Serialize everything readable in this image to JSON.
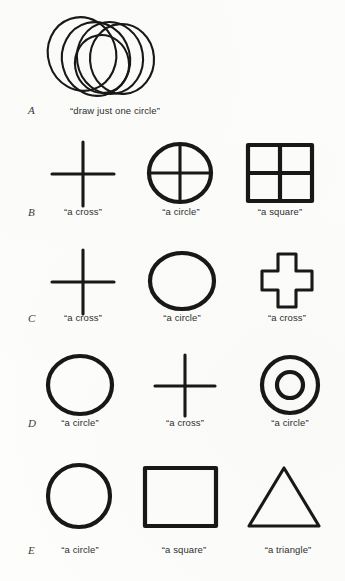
{
  "figure": {
    "background_color": "#fdfdfc",
    "ink_color": "#181817"
  },
  "rows": [
    {
      "label": "A",
      "cells": [
        {
          "shape": "multiple-overlapping-circles",
          "caption": "“draw just one circle”",
          "annotation": ""
        }
      ]
    },
    {
      "label": "B",
      "cells": [
        {
          "shape": "cross-lines",
          "caption": "“a cross”",
          "annotation": ""
        },
        {
          "shape": "circle-with-internal-cross",
          "caption": "“a circle”",
          "annotation": ""
        },
        {
          "shape": "square-with-internal-cross",
          "caption": "“a square”",
          "annotation": ""
        }
      ]
    },
    {
      "label": "C",
      "cells": [
        {
          "shape": "cross-lines",
          "caption": "“a cross”",
          "annotation": ""
        },
        {
          "shape": "circle-outline",
          "caption": "“a circle”",
          "annotation": ""
        },
        {
          "shape": "plus-polygon-outline",
          "caption": "“a cross”",
          "annotation": ""
        }
      ]
    },
    {
      "label": "D",
      "cells": [
        {
          "shape": "circle-outline",
          "caption": "“a circle”",
          "annotation": ""
        },
        {
          "shape": "cross-lines",
          "caption": "“a cross”",
          "annotation": ""
        },
        {
          "shape": "concentric-circles",
          "caption": "“a circle”",
          "annotation": ""
        }
      ]
    },
    {
      "label": "E",
      "cells": [
        {
          "shape": "circle-outline",
          "caption": "“a circle”",
          "annotation": "-Г"
        },
        {
          "shape": "square-outline",
          "caption": "“a square”",
          "annotation": "-Т"
        },
        {
          "shape": "triangle-outline",
          "caption": "“a triangle”",
          "annotation": "-К"
        }
      ]
    }
  ]
}
